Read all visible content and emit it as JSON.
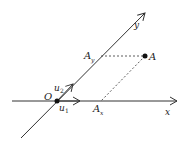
{
  "diagram": {
    "labels": {
      "origin": "O",
      "x_axis": "x",
      "y_axis": "y",
      "u1": "u",
      "u1_sub": "1",
      "u2": "u",
      "u2_sub": "2",
      "point": "A",
      "proj_x": "A",
      "proj_x_sub": "x",
      "proj_y": "A",
      "proj_y_sub": "y"
    },
    "colors": {
      "stroke": "#333333",
      "point": "#111111"
    }
  }
}
